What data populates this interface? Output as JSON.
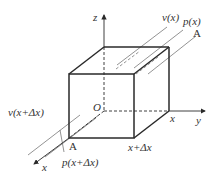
{
  "diagram": {
    "type": "cube-control-volume",
    "colors": {
      "edge": "#2a2a2a",
      "stream": "#777777",
      "background": "#ffffff"
    },
    "axes": {
      "x": "x",
      "y": "y",
      "z": "z"
    },
    "points": {
      "origin": "O",
      "corner": "A"
    },
    "labels": {
      "v_x": "v(x)",
      "p_x": "p(x)",
      "area": "A",
      "v_x_dx": "v(x+Δx)",
      "p_x_dx": "p(x+Δx)",
      "pos_x": "x",
      "pos_x_dx": "x+Δx"
    }
  }
}
